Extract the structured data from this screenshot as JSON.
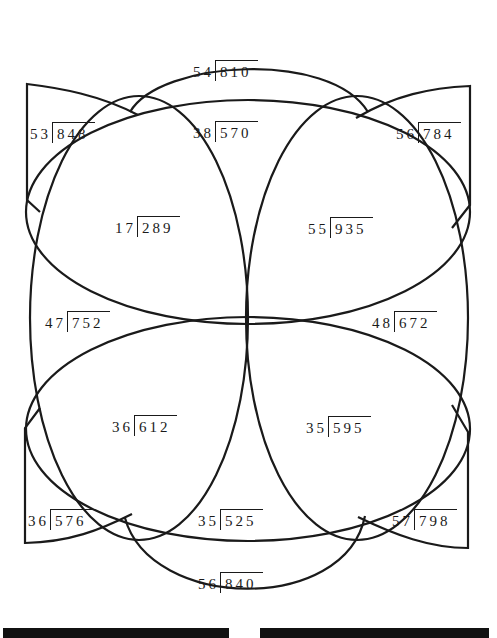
{
  "diagram": {
    "type": "division-puzzle",
    "stroke_color": "#1a1a1a",
    "problems": [
      {
        "id": "top-cap",
        "divisor": "54",
        "dividend": "810",
        "x": 193,
        "y": 62
      },
      {
        "id": "top-center",
        "divisor": "38",
        "dividend": "570",
        "x": 193,
        "y": 123
      },
      {
        "id": "top-left-wedge",
        "divisor": "53",
        "dividend": "848",
        "x": 30,
        "y": 124
      },
      {
        "id": "top-right-wedge",
        "divisor": "56",
        "dividend": "784",
        "x": 396,
        "y": 124
      },
      {
        "id": "upper-left",
        "divisor": "17",
        "dividend": "289",
        "x": 115,
        "y": 218
      },
      {
        "id": "upper-right",
        "divisor": "55",
        "dividend": "935",
        "x": 308,
        "y": 219
      },
      {
        "id": "middle-left",
        "divisor": "47",
        "dividend": "752",
        "x": 45,
        "y": 313
      },
      {
        "id": "middle-right",
        "divisor": "48",
        "dividend": "672",
        "x": 372,
        "y": 313
      },
      {
        "id": "lower-left",
        "divisor": "36",
        "dividend": "612",
        "x": 112,
        "y": 417
      },
      {
        "id": "lower-right",
        "divisor": "35",
        "dividend": "595",
        "x": 306,
        "y": 418
      },
      {
        "id": "bottom-left-wedge",
        "divisor": "36",
        "dividend": "576",
        "x": 28,
        "y": 511
      },
      {
        "id": "bottom-center",
        "divisor": "35",
        "dividend": "525",
        "x": 198,
        "y": 511
      },
      {
        "id": "bottom-right-wedge",
        "divisor": "57",
        "dividend": "798",
        "x": 392,
        "y": 511
      },
      {
        "id": "bottom-cap",
        "divisor": "56",
        "dividend": "840",
        "x": 198,
        "y": 574
      }
    ]
  },
  "answer_lines": [
    {
      "id": "answer-line-left",
      "x": 3,
      "width": 226
    },
    {
      "id": "answer-line-right",
      "x": 260,
      "width": 229
    }
  ]
}
